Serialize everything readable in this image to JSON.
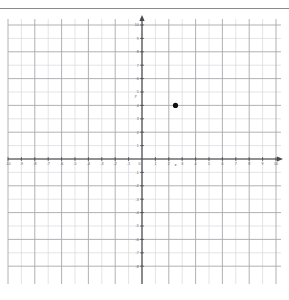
{
  "page": {
    "background_color": "#ffffff",
    "divider_color": "#8a8a8e"
  },
  "axis_labels": {
    "x": "x",
    "y": "y"
  },
  "chart_data": {
    "type": "scatter",
    "title": "",
    "xlabel": "x",
    "ylabel": "y",
    "xlim": [
      -10,
      10
    ],
    "ylim": [
      -8,
      10
    ],
    "grid": true,
    "minor_grid_step": 1,
    "major_grid_step": 2,
    "legend": null,
    "x_tick_labels": [
      "-10",
      "-9",
      "-8",
      "-7",
      "-6",
      "-5",
      "-4",
      "-3",
      "-2",
      "-1",
      "0",
      "1",
      "2",
      "3",
      "4",
      "5",
      "6",
      "7",
      "8",
      "9",
      "10"
    ],
    "x_tick_values": [
      -10,
      -9,
      -8,
      -7,
      -6,
      -5,
      -4,
      -3,
      -2,
      -1,
      0,
      1,
      2,
      3,
      4,
      5,
      6,
      7,
      8,
      9,
      10
    ],
    "y_tick_labels": [
      "-8",
      "-7",
      "-6",
      "-5",
      "-4",
      "-3",
      "-2",
      "-1",
      "1",
      "2",
      "3",
      "4",
      "5",
      "6",
      "7",
      "8",
      "9",
      "10"
    ],
    "y_tick_values": [
      -8,
      -7,
      -6,
      -5,
      -4,
      -3,
      -2,
      -1,
      1,
      2,
      3,
      4,
      5,
      6,
      7,
      8,
      9,
      10
    ],
    "origin_label": "0",
    "points": [
      {
        "x": 2.5,
        "y": 4,
        "color": "#111114",
        "radius": 2.6
      }
    ],
    "series": [
      {
        "name": "plotted point",
        "x": [
          2.5
        ],
        "y": [
          4
        ]
      }
    ],
    "colors": {
      "minor_grid": "#d8d8dc",
      "major_grid": "#a9a9ae",
      "axis": "#4a4a4e",
      "point": "#111114"
    }
  }
}
